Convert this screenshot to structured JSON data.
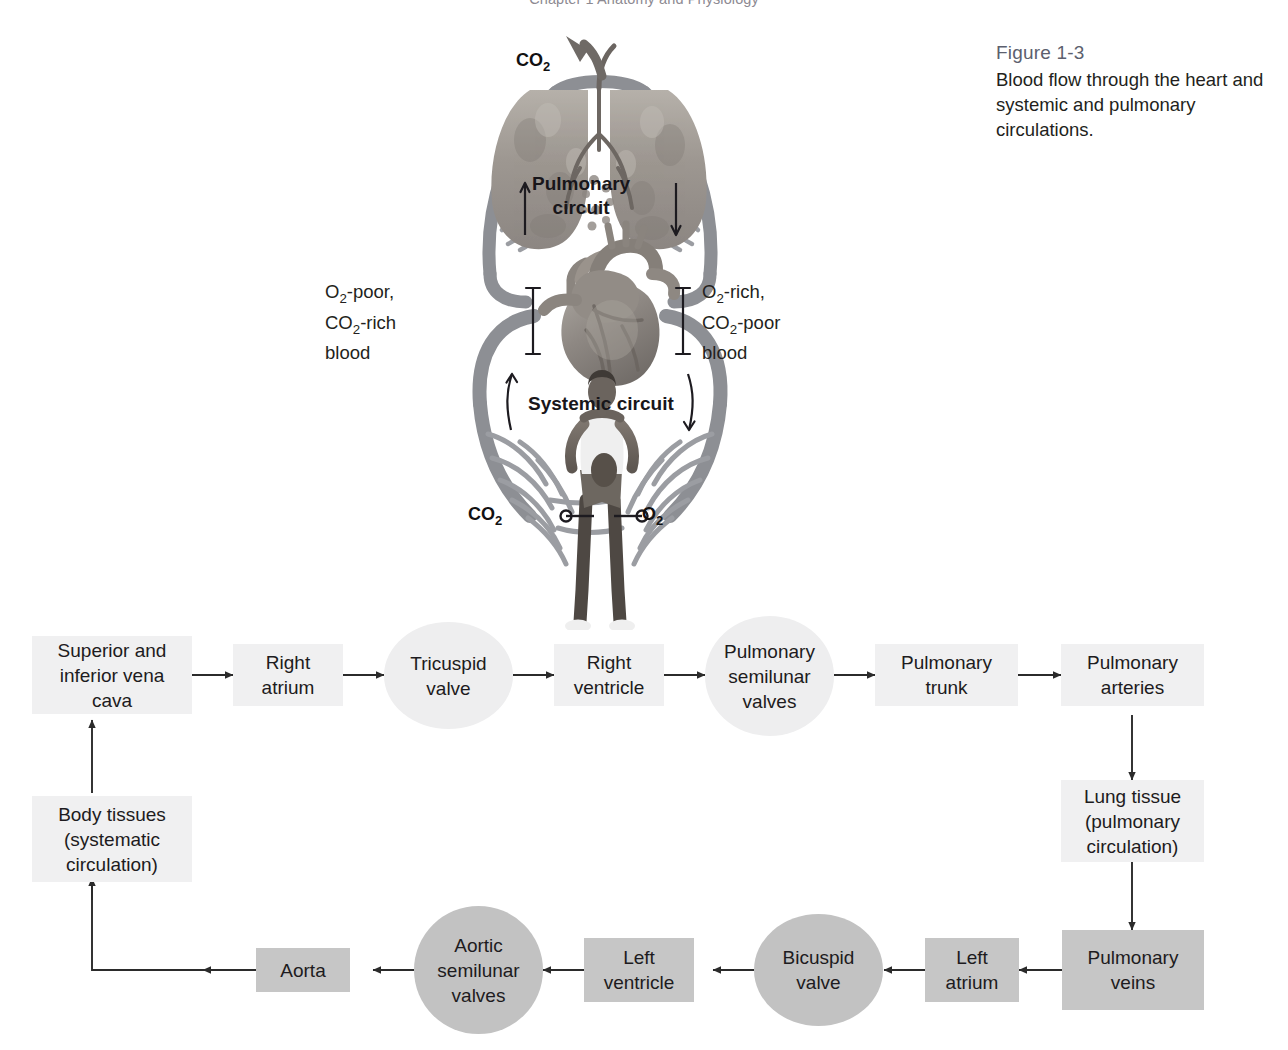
{
  "running_header": {
    "text": "Chapter 1  Anatomy and Physiology",
    "visible": "clipped"
  },
  "caption": {
    "figure_number": "Figure 1-3",
    "figure_text": "Blood flow through the heart and systemic and pulmonary circulations."
  },
  "diagram": {
    "co2_out_label": "CO2",
    "pulmonary_circuit_label_line1": "Pulmonary",
    "pulmonary_circuit_label_line2": "circuit",
    "systemic_circuit_label": "Systemic circuit",
    "left_blood_label_line1": "O2-poor,",
    "left_blood_label_line2": "CO2-rich",
    "left_blood_label_line3": "blood",
    "right_blood_label_line1": "O2-rich,",
    "right_blood_label_line2": "CO2-poor",
    "right_blood_label_line3": "blood",
    "tissue_co2_label": "CO2",
    "tissue_o2_label": "O2",
    "illustrations": {
      "lungs": "lungs-illustration",
      "heart": "heart-illustration",
      "body": "human-body-illustration",
      "vessels": "blood-vessel-loops"
    },
    "colors": {
      "vessel": "#8d8f94",
      "capillary": "#9b9da2",
      "text": "#231f20"
    }
  },
  "flowchart": {
    "colors": {
      "light_fill": "#f0f0f1",
      "dark_fill": "#c6c6c6",
      "arrow": "#2b2b2b"
    },
    "nodes": [
      {
        "id": "vena-cava",
        "label": "Superior and inferior vena cava",
        "shape": "rect",
        "tone": "light"
      },
      {
        "id": "right-atrium",
        "label": "Right atrium",
        "shape": "rect",
        "tone": "light"
      },
      {
        "id": "tricuspid-valve",
        "label": "Tricuspid valve",
        "shape": "circle",
        "tone": "light"
      },
      {
        "id": "right-ventricle",
        "label": "Right ventricle",
        "shape": "rect",
        "tone": "light"
      },
      {
        "id": "pulmonary-semilunar-valves",
        "label": "Pulmonary semilunar valves",
        "shape": "circle",
        "tone": "light"
      },
      {
        "id": "pulmonary-trunk",
        "label": "Pulmonary trunk",
        "shape": "rect",
        "tone": "light"
      },
      {
        "id": "pulmonary-arteries",
        "label": "Pulmonary arteries",
        "shape": "rect",
        "tone": "light"
      },
      {
        "id": "lung-tissue",
        "label": "Lung tissue (pulmonary circulation)",
        "shape": "rect",
        "tone": "light"
      },
      {
        "id": "pulmonary-veins",
        "label": "Pulmonary veins",
        "shape": "rect",
        "tone": "dark"
      },
      {
        "id": "left-atrium",
        "label": "Left atrium",
        "shape": "rect",
        "tone": "dark"
      },
      {
        "id": "bicuspid-valve",
        "label": "Bicuspid valve",
        "shape": "circle",
        "tone": "dark"
      },
      {
        "id": "left-ventricle",
        "label": "Left ventricle",
        "shape": "rect",
        "tone": "dark"
      },
      {
        "id": "aortic-semilunar-valves",
        "label": "Aortic semilunar valves",
        "shape": "circle",
        "tone": "dark"
      },
      {
        "id": "aorta",
        "label": "Aorta",
        "shape": "rect",
        "tone": "dark"
      },
      {
        "id": "body-tissues",
        "label": "Body tissues (systematic circulation)",
        "shape": "rect",
        "tone": "light"
      }
    ],
    "node_labels": {
      "vena_cava": "Superior and inferior vena cava",
      "right_atrium": "Right atrium",
      "tricuspid_valve": "Tricuspid valve",
      "right_ventricle": "Right ventricle",
      "pulmonary_semilunar_valves": "Pulmonary semilunar valves",
      "pulmonary_trunk": "Pulmonary trunk",
      "pulmonary_arteries": "Pulmonary arteries",
      "lung_tissue": "Lung tissue (pulmonary circulation)",
      "pulmonary_veins": "Pulmonary veins",
      "left_atrium": "Left atrium",
      "bicuspid_valve": "Bicuspid valve",
      "left_ventricle": "Left ventricle",
      "aortic_semilunar_valves": "Aortic semilunar valves",
      "aorta": "Aorta",
      "body_tissues": "Body tissues (systematic circulation)"
    }
  }
}
